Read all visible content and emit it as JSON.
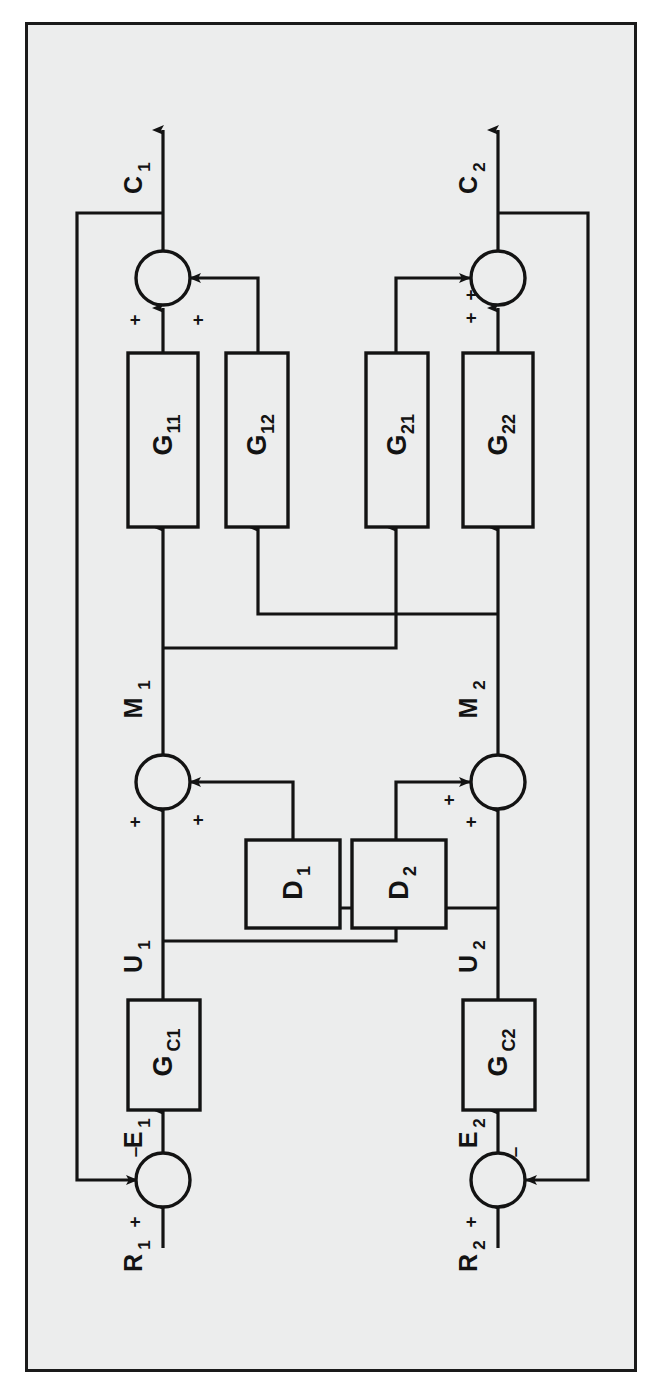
{
  "figure": {
    "kind": "block-diagram",
    "background_color": "#eceded",
    "line_color": "#131313",
    "border_color": "#1a1a1a",
    "orientation": "rotated-90-ccw"
  },
  "blocks": [
    {
      "id": "g11",
      "label": "G",
      "sub": "11"
    },
    {
      "id": "g12",
      "label": "G",
      "sub": "12"
    },
    {
      "id": "g21",
      "label": "G",
      "sub": "21"
    },
    {
      "id": "g22",
      "label": "G",
      "sub": "22"
    },
    {
      "id": "d1",
      "label": "D",
      "sub": "1"
    },
    {
      "id": "d2",
      "label": "D",
      "sub": "2"
    },
    {
      "id": "gc1",
      "label": "G",
      "sub": "C1"
    },
    {
      "id": "gc2",
      "label": "G",
      "sub": "C2"
    }
  ],
  "signals": [
    {
      "id": "c1",
      "label": "C",
      "sub": "1"
    },
    {
      "id": "c2",
      "label": "C",
      "sub": "2"
    },
    {
      "id": "m1",
      "label": "M",
      "sub": "1"
    },
    {
      "id": "m2",
      "label": "M",
      "sub": "2"
    },
    {
      "id": "u1",
      "label": "U",
      "sub": "1"
    },
    {
      "id": "u2",
      "label": "U",
      "sub": "2"
    },
    {
      "id": "e1",
      "label": "E",
      "sub": "1"
    },
    {
      "id": "e2",
      "label": "E",
      "sub": "2"
    },
    {
      "id": "r1",
      "label": "R",
      "sub": "1"
    },
    {
      "id": "r2",
      "label": "R",
      "sub": "2"
    }
  ],
  "summing_junctions": [
    {
      "id": "sum-c1",
      "output": "C1",
      "signs": [
        {
          "id": "sum-c1-plus-a",
          "symbol": "+"
        },
        {
          "id": "sum-c1-plus-b",
          "symbol": "+"
        }
      ]
    },
    {
      "id": "sum-c2",
      "output": "C2",
      "signs": [
        {
          "id": "sum-c2-plus-a",
          "symbol": "+"
        },
        {
          "id": "sum-c2-plus-b",
          "symbol": "+"
        }
      ]
    },
    {
      "id": "sum-m1",
      "output": "M1",
      "signs": [
        {
          "id": "sum-m1-plus-a",
          "symbol": "+"
        },
        {
          "id": "sum-m1-plus-b",
          "symbol": "+"
        }
      ]
    },
    {
      "id": "sum-m2",
      "output": "M2",
      "signs": [
        {
          "id": "sum-m2-plus-a",
          "symbol": "+"
        },
        {
          "id": "sum-m2-plus-b",
          "symbol": "+"
        }
      ]
    },
    {
      "id": "sum-e1",
      "output": "E1",
      "signs": [
        {
          "id": "sum-e1-plus",
          "symbol": "+"
        },
        {
          "id": "sum-e1-minus",
          "symbol": "–"
        }
      ]
    },
    {
      "id": "sum-e2",
      "output": "E2",
      "signs": [
        {
          "id": "sum-e2-plus",
          "symbol": "+"
        },
        {
          "id": "sum-e2-minus",
          "symbol": "–"
        }
      ]
    }
  ],
  "labels": {
    "g11": "G",
    "g11_sub": "11",
    "g12": "G",
    "g12_sub": "12",
    "g21": "G",
    "g21_sub": "21",
    "g22": "G",
    "g22_sub": "22",
    "d1": "D",
    "d1_sub": "1",
    "d2": "D",
    "d2_sub": "2",
    "gc1": "G",
    "gc1_sub": "C1",
    "gc2": "G",
    "gc2_sub": "C2",
    "c1": "C",
    "c1_sub": "1",
    "c2": "C",
    "c2_sub": "2",
    "m1": "M",
    "m1_sub": "1",
    "m2": "M",
    "m2_sub": "2",
    "u1": "U",
    "u1_sub": "1",
    "u2": "U",
    "u2_sub": "2",
    "e1": "E",
    "e1_sub": "1",
    "e2": "E",
    "e2_sub": "2",
    "r1": "R",
    "r1_sub": "1",
    "r2": "R",
    "r2_sub": "2",
    "plus": "+",
    "minus": "–"
  }
}
